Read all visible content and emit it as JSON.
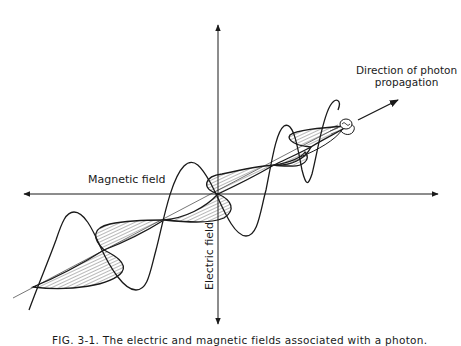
{
  "figure": {
    "labels": {
      "direction_line1": "Direction of photon",
      "direction_line2": "propagation",
      "magnetic_field": "Magnetic field",
      "electric_field": "Electric field"
    },
    "caption": "FIG. 3-1. The electric and magnetic fields associated with a photon.",
    "colors": {
      "ink": "#1a1a1a",
      "background": "#ffffff",
      "hatch": "#333333"
    }
  }
}
